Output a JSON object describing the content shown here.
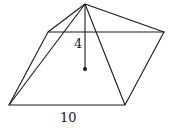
{
  "diagram": {
    "type": "square-pyramid",
    "labels": {
      "height": "4",
      "base_side": "10"
    },
    "vertices": {
      "apex": [
        85,
        4
      ],
      "base_front_left": [
        9,
        105
      ],
      "base_front_right": [
        125,
        105
      ],
      "base_back_right": [
        164,
        32
      ],
      "base_back_left": [
        48,
        32
      ],
      "base_center": [
        85,
        69
      ]
    },
    "colors": {
      "stroke": "#1a1a1a",
      "background": "#ffffff"
    }
  }
}
